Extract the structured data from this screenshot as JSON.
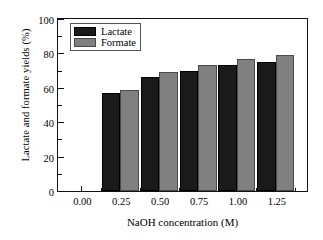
{
  "chart_data": {
    "type": "bar",
    "title": "",
    "subtitle": "",
    "xlabel": "NaOH concentration (M)",
    "ylabel": "Lactate and formate yields (%)",
    "categories": [
      "0.00",
      "0.25",
      "0.50",
      "0.75",
      "1.00",
      "1.25"
    ],
    "x": [
      0.0,
      0.25,
      0.5,
      0.75,
      1.0,
      1.25
    ],
    "series": [
      {
        "name": "Lactate",
        "color": "#1a1a1a",
        "values": [
          0,
          57,
          66,
          70,
          73,
          75
        ]
      },
      {
        "name": "Formate",
        "color": "#808080",
        "values": [
          0,
          59,
          69,
          73,
          77,
          79
        ]
      }
    ],
    "ylim": [
      0,
      100
    ],
    "xlim": [
      -0.15,
      1.45
    ],
    "ytick_values": [
      0,
      20,
      40,
      60,
      80,
      100
    ],
    "ytick_labels": [
      "0",
      "20",
      "40",
      "60",
      "80",
      "100"
    ],
    "ytick_minor_values": [
      10,
      30,
      50,
      70,
      90
    ],
    "xtick_values": [
      0.0,
      0.25,
      0.5,
      0.75,
      1.0,
      1.25
    ],
    "xtick_labels": [
      "0.00",
      "0.25",
      "0.50",
      "0.75",
      "1.00",
      "1.25"
    ],
    "xtick_minor_values": [
      0.125,
      0.375,
      0.625,
      0.875,
      1.125,
      1.375
    ],
    "grid": false,
    "legend": {
      "position": "top-left-inside",
      "entries": [
        {
          "label": "Lactate",
          "color": "#1a1a1a"
        },
        {
          "label": "Formate",
          "color": "#808080"
        }
      ]
    }
  }
}
